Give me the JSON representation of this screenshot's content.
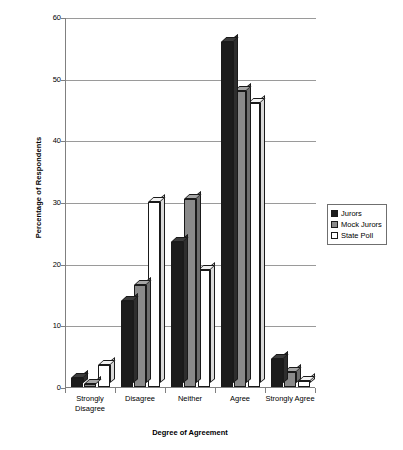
{
  "chart_data": {
    "type": "bar",
    "title": "",
    "xlabel": "Degree of Agreement",
    "ylabel": "Percentage of Respondents",
    "ylim": [
      0,
      60
    ],
    "yticks": [
      0,
      10,
      20,
      30,
      40,
      50,
      60
    ],
    "grid": true,
    "legend_position": "right",
    "style": "3d-clustered-column",
    "categories": [
      "Strongly Disagree",
      "Disagree",
      "Neither",
      "Agree",
      "Strongly Agree"
    ],
    "category_lines": [
      [
        "Strongly",
        "Disagree"
      ],
      [
        "Disagree",
        ""
      ],
      [
        "Neither",
        ""
      ],
      [
        "Agree",
        ""
      ],
      [
        "Strongly Agree",
        ""
      ]
    ],
    "series": [
      {
        "name": "Jurors",
        "color": "#1c1c1c",
        "values": [
          1.5,
          14,
          23.5,
          56,
          4.5
        ]
      },
      {
        "name": "Mock Jurors",
        "color": "#8a8a8a",
        "values": [
          0.5,
          16.5,
          30.5,
          48,
          2.5
        ]
      },
      {
        "name": "State Poll",
        "color": "#ffffff",
        "values": [
          3.5,
          30,
          19,
          46,
          1
        ]
      }
    ]
  },
  "axis": {
    "y_title": "Percentage of Respondents",
    "x_title": "Degree of Agreement",
    "y_tick_labels": [
      "0",
      "10",
      "20",
      "30",
      "40",
      "50",
      "60"
    ]
  },
  "legend": {
    "items": [
      {
        "label": "Jurors"
      },
      {
        "label": "Mock Jurors"
      },
      {
        "label": "State Poll"
      }
    ]
  }
}
